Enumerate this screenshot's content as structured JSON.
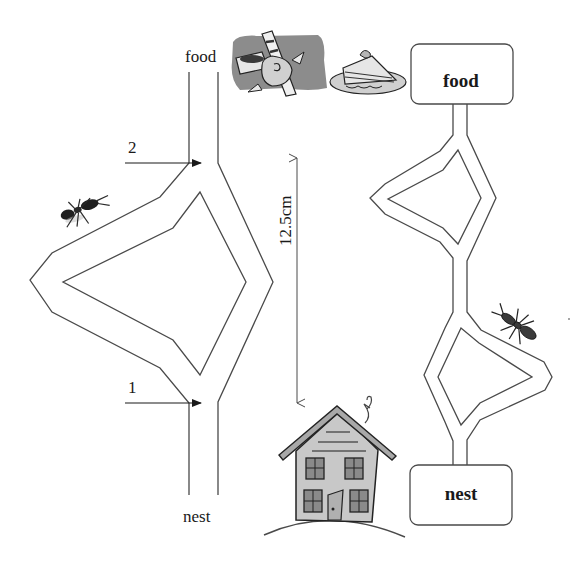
{
  "left_maze": {
    "top_label": "food",
    "bottom_label": "nest",
    "arrow_upper_label": "2",
    "arrow_lower_label": "1"
  },
  "scale": {
    "label": "12.5cm"
  },
  "right_maze": {
    "top_box_label": "food",
    "bottom_box_label": "nest"
  },
  "illustrations": {
    "food_clipart": "candy-and-cake",
    "nest_clipart": "house",
    "ant_left": "ant",
    "ant_right": "ant"
  },
  "colors": {
    "line": "#4a4a4a",
    "text": "#1a1a1a",
    "clipart_gray": "#8c8c8c",
    "house_fill": "#c8c8c8"
  }
}
